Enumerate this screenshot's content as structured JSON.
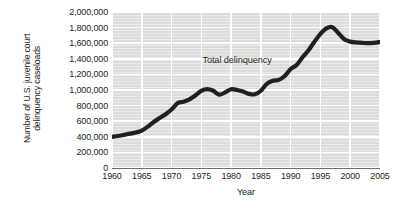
{
  "chart_data": {
    "type": "line",
    "title": "",
    "xlabel": "Year",
    "ylabel": "Number of U.S. juvenile court delinquency caseloads",
    "ylabel_lines": [
      "Number of U.S. juvenile court",
      "delinquency caseloads"
    ],
    "xlim": [
      1960,
      2005
    ],
    "ylim": [
      0,
      2000000
    ],
    "grid": true,
    "legend": "none",
    "xticks": [
      1960,
      1965,
      1970,
      1975,
      1980,
      1985,
      1990,
      1995,
      2000,
      2005
    ],
    "xtick_labels": [
      "1960",
      "1965",
      "1970",
      "1975",
      "1980",
      "1985",
      "1990",
      "1995",
      "2000",
      "2005"
    ],
    "yticks": [
      0,
      200000,
      400000,
      600000,
      800000,
      1000000,
      1200000,
      1400000,
      1600000,
      1800000,
      2000000
    ],
    "ytick_labels": [
      "0",
      "200,000",
      "400,000",
      "600,000",
      "800,000",
      "1,000,000",
      "1,200,000",
      "1,400,000",
      "1,600,000",
      "1,800,000",
      "2,000,000"
    ],
    "annotations": [
      {
        "text": "Total delinquency",
        "x": 1981,
        "y": 1390000
      }
    ],
    "series": [
      {
        "name": "Total delinquency",
        "color": "#231f20",
        "x": [
          1960,
          1961,
          1962,
          1963,
          1964,
          1965,
          1966,
          1967,
          1968,
          1969,
          1970,
          1971,
          1972,
          1973,
          1974,
          1975,
          1976,
          1977,
          1978,
          1979,
          1980,
          1981,
          1982,
          1983,
          1984,
          1985,
          1986,
          1987,
          1988,
          1989,
          1990,
          1991,
          1992,
          1993,
          1994,
          1995,
          1996,
          1997,
          1998,
          1999,
          2000,
          2001,
          2002,
          2003,
          2004,
          2005
        ],
        "values": [
          400000,
          410000,
          425000,
          440000,
          455000,
          480000,
          530000,
          590000,
          640000,
          690000,
          750000,
          830000,
          850000,
          880000,
          930000,
          990000,
          1010000,
          990000,
          940000,
          970000,
          1010000,
          1000000,
          980000,
          950000,
          945000,
          990000,
          1080000,
          1120000,
          1130000,
          1180000,
          1270000,
          1320000,
          1420000,
          1510000,
          1620000,
          1720000,
          1790000,
          1805000,
          1730000,
          1650000,
          1620000,
          1610000,
          1605000,
          1600000,
          1605000,
          1615000
        ]
      }
    ]
  },
  "axes": {
    "x_axis_title": "Year"
  }
}
